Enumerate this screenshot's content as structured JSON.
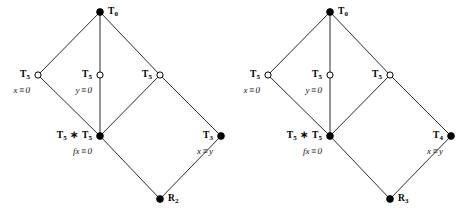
{
  "figure": {
    "colors": {
      "edge": "#2b2b2b",
      "node_fill": "#000000",
      "node_open_fill": "#ffffff",
      "node_stroke": "#000000",
      "text": "#000000",
      "background": "#ffffff"
    },
    "geometry": {
      "width": 471,
      "height": 221,
      "diagram_offsets": [
        0,
        230
      ]
    }
  },
  "diagrams": [
    {
      "id": "left-diagram",
      "nodes": [
        {
          "id": "top",
          "key": "T0",
          "x": 100,
          "y": 12,
          "style": "filled",
          "label_main_text": "T",
          "label_main_sub": "0",
          "label_eq": "",
          "label_pos": "right"
        },
        {
          "id": "left-upper",
          "key": "T5-x",
          "x": 38,
          "y": 75,
          "style": "open",
          "label_main_text": "T",
          "label_main_sub": "5",
          "label_eq": "x ≡ 0",
          "label_pos": "left"
        },
        {
          "id": "mid-upper",
          "key": "T5-y",
          "x": 100,
          "y": 75,
          "style": "open",
          "label_main_text": "T",
          "label_main_sub": "5",
          "label_eq": "y ≡ 0",
          "label_pos": "left"
        },
        {
          "id": "right-upper",
          "key": "T5-r",
          "x": 160,
          "y": 75,
          "style": "open",
          "label_main_text": "T",
          "label_main_sub": "5",
          "label_eq": "",
          "label_pos": "left"
        },
        {
          "id": "mid-lower",
          "key": "T5xT5",
          "x": 100,
          "y": 136,
          "style": "filled",
          "label_main_text": "T",
          "label_main_sub": "5",
          "label_main_text2": "T",
          "label_main_sub2": "5",
          "label_main_sep": "∗",
          "label_eq": "fx ≡ 0",
          "label_pos": "left"
        },
        {
          "id": "right-lower",
          "key": "T3",
          "x": 221,
          "y": 136,
          "style": "filled",
          "label_main_text": "T",
          "label_main_sub": "3",
          "label_eq": "x ≡ y",
          "label_pos": "left"
        },
        {
          "id": "bottom",
          "key": "R2",
          "x": 160,
          "y": 199,
          "style": "filled",
          "label_main_text": "R",
          "label_main_sub": "2",
          "label_eq": "",
          "label_pos": "right"
        }
      ],
      "edges": [
        [
          "top",
          "left-upper"
        ],
        [
          "top",
          "mid-upper"
        ],
        [
          "top",
          "right-upper"
        ],
        [
          "left-upper",
          "mid-lower"
        ],
        [
          "mid-upper",
          "mid-lower"
        ],
        [
          "right-upper",
          "mid-lower"
        ],
        [
          "right-upper",
          "right-lower"
        ],
        [
          "mid-lower",
          "bottom"
        ],
        [
          "right-lower",
          "bottom"
        ]
      ]
    },
    {
      "id": "right-diagram",
      "nodes": [
        {
          "id": "top",
          "key": "T0",
          "x": 100,
          "y": 12,
          "style": "filled",
          "label_main_text": "T",
          "label_main_sub": "0",
          "label_eq": "",
          "label_pos": "right"
        },
        {
          "id": "left-upper",
          "key": "T5-x",
          "x": 38,
          "y": 75,
          "style": "open",
          "label_main_text": "T",
          "label_main_sub": "5",
          "label_eq": "x ≡ 0",
          "label_pos": "left"
        },
        {
          "id": "mid-upper",
          "key": "T5-y",
          "x": 100,
          "y": 75,
          "style": "open",
          "label_main_text": "T",
          "label_main_sub": "5",
          "label_eq": "y ≡ 0",
          "label_pos": "left"
        },
        {
          "id": "right-upper",
          "key": "T5-r",
          "x": 160,
          "y": 75,
          "style": "open",
          "label_main_text": "T",
          "label_main_sub": "5",
          "label_eq": "",
          "label_pos": "left"
        },
        {
          "id": "mid-lower",
          "key": "T5xT5",
          "x": 100,
          "y": 136,
          "style": "filled",
          "label_main_text": "T",
          "label_main_sub": "5",
          "label_main_text2": "T",
          "label_main_sub2": "5",
          "label_main_sep": "∗",
          "label_eq": "fx ≡ 0",
          "label_pos": "left"
        },
        {
          "id": "right-lower",
          "key": "T4",
          "x": 221,
          "y": 136,
          "style": "filled",
          "label_main_text": "T",
          "label_main_sub": "4",
          "label_eq": "x ≡ y",
          "label_pos": "left"
        },
        {
          "id": "bottom",
          "key": "R3",
          "x": 160,
          "y": 199,
          "style": "filled",
          "label_main_text": "R",
          "label_main_sub": "3",
          "label_eq": "",
          "label_pos": "right"
        }
      ],
      "edges": [
        [
          "top",
          "left-upper"
        ],
        [
          "top",
          "mid-upper"
        ],
        [
          "top",
          "right-upper"
        ],
        [
          "left-upper",
          "mid-lower"
        ],
        [
          "mid-upper",
          "mid-lower"
        ],
        [
          "right-upper",
          "mid-lower"
        ],
        [
          "right-upper",
          "right-lower"
        ],
        [
          "mid-lower",
          "bottom"
        ],
        [
          "right-lower",
          "bottom"
        ]
      ]
    }
  ]
}
